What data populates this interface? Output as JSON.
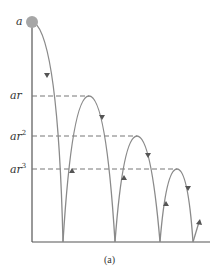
{
  "diagram": {
    "caption": "(a)",
    "labels": {
      "a": "a",
      "ar": "ar",
      "ar2_base": "ar",
      "ar2_exp": "2",
      "ar3_base": "ar",
      "ar3_exp": "3"
    },
    "colors": {
      "curve": "#8a8a8a",
      "arrow": "#555555",
      "dash": "#777777",
      "ball": "#a6a6a6",
      "axis": "#444444"
    }
  }
}
